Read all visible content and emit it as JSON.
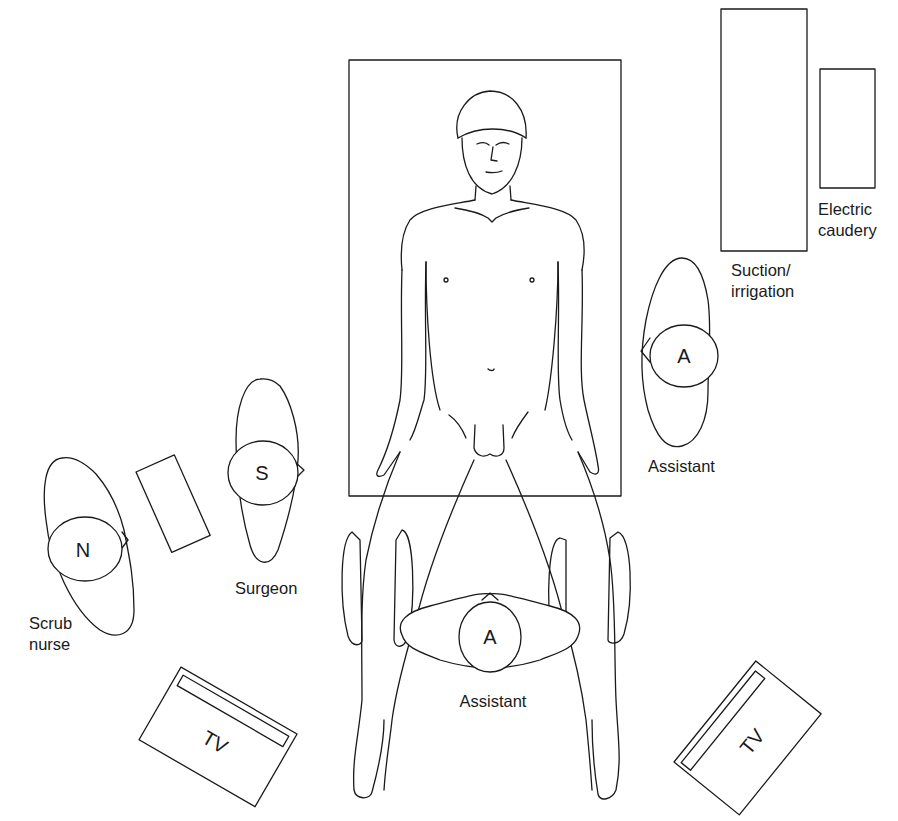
{
  "diagram": {
    "type": "operating-room-layout",
    "colors": {
      "line": "#1a1a1a",
      "background": "#ffffff"
    },
    "equipment": {
      "suction_irrigation": {
        "label_line1": "Suction/",
        "label_line2": "irrigation"
      },
      "electric_caudery": {
        "label_line1": "Electric",
        "label_line2": "caudery"
      },
      "tv_left": {
        "label": "TV"
      },
      "tv_right": {
        "label": "TV"
      },
      "instrument_table": {
        "label": ""
      }
    },
    "staff": {
      "scrub_nurse": {
        "marker": "N",
        "label_line1": "Scrub",
        "label_line2": "nurse"
      },
      "surgeon": {
        "marker": "S",
        "label": "Surgeon"
      },
      "assistant_right": {
        "marker": "A",
        "label": "Assistant"
      },
      "assistant_bottom": {
        "marker": "A",
        "label": "Assistant"
      }
    },
    "patient": {
      "position": "supine, legs abducted (lithotomy-like)"
    }
  }
}
